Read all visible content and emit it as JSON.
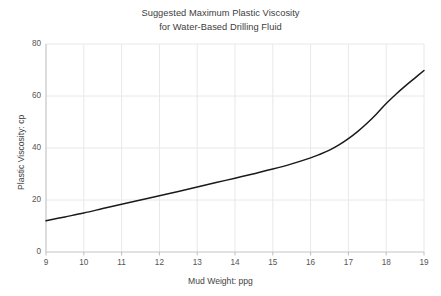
{
  "chart_data": {
    "type": "line",
    "title_line1": "Suggested Maximum Plastic Viscosity",
    "title_line2": "for Water-Based Drilling Fluid",
    "xlabel": "Mud Weight: ppg",
    "ylabel": "Plastic Viscosity: cp",
    "xlim": [
      9,
      19
    ],
    "ylim": [
      0,
      80
    ],
    "grid": true,
    "legend": "none",
    "line_color": "#1a1a1a",
    "grid_color": "#e8e8e8",
    "axis_color": "#bfbfbf",
    "xticks": [
      9,
      10,
      11,
      12,
      13,
      14,
      15,
      16,
      17,
      18,
      19
    ],
    "xtick_labels": [
      "9",
      "10",
      "11",
      "12",
      "13",
      "14",
      "15",
      "16",
      "17",
      "18",
      "19"
    ],
    "yticks": [
      0,
      20,
      40,
      60,
      80
    ],
    "ytick_labels": [
      "0",
      "20",
      "40",
      "60",
      "80"
    ],
    "series": [
      {
        "name": "Suggested Maximum Plastic Viscosity",
        "x": [
          9,
          9.5,
          10,
          10.5,
          11,
          11.5,
          12,
          12.5,
          13,
          13.5,
          14,
          14.5,
          15,
          15.5,
          16,
          16.25,
          16.5,
          16.75,
          17,
          17.25,
          17.5,
          17.75,
          18,
          18.25,
          18.5,
          18.75,
          19
        ],
        "values": [
          12,
          13.5,
          15,
          16.7,
          18.4,
          20,
          21.6,
          23.3,
          25,
          26.7,
          28.4,
          30.1,
          31.9,
          33.9,
          36.2,
          37.6,
          39.2,
          41.2,
          43.6,
          46.4,
          49.6,
          53.2,
          57.1,
          60.6,
          63.8,
          66.8,
          69.8
        ]
      }
    ]
  }
}
